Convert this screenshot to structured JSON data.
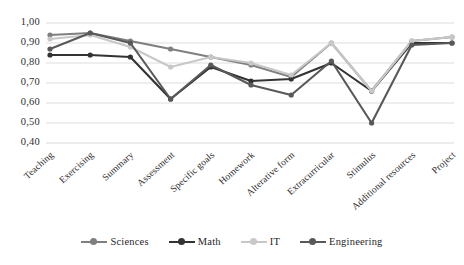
{
  "chart_data": {
    "type": "line",
    "title": "",
    "xlabel": "",
    "ylabel": "",
    "grid": true,
    "legend_position": "bottom",
    "categories": [
      "Teaching",
      "Exercising",
      "Summary",
      "Assessment",
      "Specific goals",
      "Homework",
      "Alterative form",
      "Extracurricular",
      "Stimulus",
      "Additional resources",
      "Project"
    ],
    "ylim": [
      0.4,
      1.0
    ],
    "ytick_labels": [
      "1,00",
      "0,90",
      "0,80",
      "0,70",
      "0,60",
      "0,50",
      "0,40"
    ],
    "ytick_values": [
      1.0,
      0.9,
      0.8,
      0.7,
      0.6,
      0.5,
      0.4
    ],
    "series": [
      {
        "name": "Sciences",
        "color": "#7f7f7f",
        "values": [
          0.94,
          0.95,
          0.91,
          0.87,
          0.83,
          0.79,
          0.73,
          0.9,
          0.66,
          0.91,
          0.93
        ]
      },
      {
        "name": "Math",
        "color": "#333333",
        "values": [
          0.84,
          0.84,
          0.83,
          0.62,
          0.78,
          0.71,
          0.72,
          0.8,
          0.66,
          0.9,
          0.9
        ]
      },
      {
        "name": "IT",
        "color": "#c8c8c8",
        "values": [
          0.92,
          0.94,
          0.88,
          0.78,
          0.83,
          0.8,
          0.74,
          0.9,
          0.66,
          0.91,
          0.93
        ]
      },
      {
        "name": "Engineering",
        "color": "#595959",
        "values": [
          0.87,
          0.95,
          0.9,
          0.62,
          0.79,
          0.69,
          0.64,
          0.81,
          0.5,
          0.89,
          0.9
        ]
      }
    ]
  }
}
